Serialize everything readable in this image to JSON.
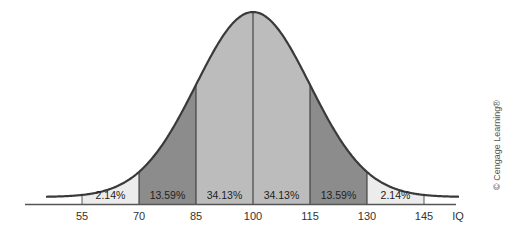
{
  "chart_data": {
    "type": "area",
    "title": "",
    "subtitle": "",
    "xlabel": "IQ",
    "ylabel": "",
    "distribution": "normal",
    "mean": 100,
    "sd": 15,
    "x_ticks": [
      55,
      70,
      85,
      100,
      115,
      130,
      145
    ],
    "x_axis_end_label": "IQ",
    "segments": [
      {
        "from": 55,
        "to": 70,
        "label": "2.14%",
        "value": 2.14,
        "color": "#ececec"
      },
      {
        "from": 70,
        "to": 85,
        "label": "13.59%",
        "value": 13.59,
        "color": "#8c8c8c"
      },
      {
        "from": 85,
        "to": 100,
        "label": "34.13%",
        "value": 34.13,
        "color": "#bcbcbc"
      },
      {
        "from": 100,
        "to": 115,
        "label": "34.13%",
        "value": 34.13,
        "color": "#bcbcbc"
      },
      {
        "from": 115,
        "to": 130,
        "label": "13.59%",
        "value": 13.59,
        "color": "#8c8c8c"
      },
      {
        "from": 130,
        "to": 145,
        "label": "2.14%",
        "value": 2.14,
        "color": "#ececec"
      }
    ],
    "grid": false,
    "legend": "none"
  },
  "credit": "© Cengage Learning®",
  "colors": {
    "curve": "#3a3a3a",
    "axis": "#555555"
  }
}
